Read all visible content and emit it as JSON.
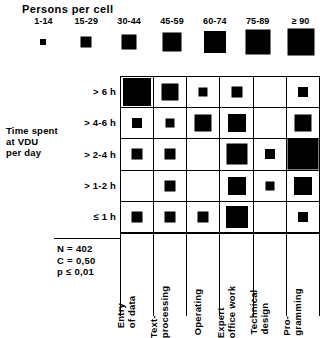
{
  "legend": {
    "title": "Persons per cell",
    "items": [
      {
        "label": "1-14",
        "size": 6,
        "range_min": 1,
        "range_max": 14
      },
      {
        "label": "15-29",
        "size": 11,
        "range_min": 15,
        "range_max": 29
      },
      {
        "label": "30-44",
        "size": 15,
        "range_min": 30,
        "range_max": 44
      },
      {
        "label": "45-59",
        "size": 19,
        "range_min": 45,
        "range_max": 59
      },
      {
        "label": "60-74",
        "size": 22,
        "range_min": 60,
        "range_max": 74
      },
      {
        "label": "75-89",
        "size": 25,
        "range_min": 75,
        "range_max": 89
      },
      {
        "label": "≥ 90",
        "size": 27,
        "range_min": 90,
        "range_max": null
      }
    ]
  },
  "y_axis": {
    "title": "Time spent\nat VDU\nper day",
    "title_lines": [
      "Time spent",
      "at VDU",
      "per day"
    ],
    "categories": [
      "> 6 h",
      "> 4-6 h",
      "> 2-4 h",
      "> 1-2 h",
      "≤ 1 h"
    ]
  },
  "x_axis": {
    "categories": [
      "Entry of data",
      "Text-processing",
      "Operating",
      "Expert office work",
      "Technical design",
      "Pro-gramming"
    ],
    "category_lines": [
      [
        "Entry",
        "of data"
      ],
      [
        "Text-",
        "processing"
      ],
      [
        "Operating"
      ],
      [
        "Expert",
        "office work"
      ],
      [
        "Technical",
        "design"
      ],
      [
        "Pro-",
        "gramming"
      ]
    ]
  },
  "stats": {
    "n_label": "N = 402",
    "c_label": "C = 0,50",
    "p_label": "p ≤ 0,01"
  },
  "chart_data": {
    "type": "heatmap",
    "title": "Persons per cell",
    "subtype": "size-coded matrix (symbol-area plot)",
    "xlabel": "",
    "ylabel": "Time spent at VDU per day",
    "grid": true,
    "legend_position": "top",
    "legend_title": "Persons per cell",
    "legend_bins": [
      "1-14",
      "15-29",
      "30-44",
      "45-59",
      "60-74",
      "75-89",
      "≥ 90"
    ],
    "legend_bin_sizes_px": [
      6,
      11,
      15,
      19,
      22,
      25,
      27
    ],
    "x_categories": [
      "Entry of data",
      "Text-processing",
      "Operating",
      "Expert office work",
      "Technical design",
      "Pro-gramming"
    ],
    "y_categories": [
      "> 6 h",
      "> 4-6 h",
      "> 2-4 h",
      "> 1-2 h",
      "≤ 1 h"
    ],
    "cells": [
      {
        "row": "> 6 h",
        "col": "Entry of data",
        "bin": "≥ 90",
        "size": 28
      },
      {
        "row": "> 6 h",
        "col": "Text-processing",
        "bin": "45-59",
        "size": 17
      },
      {
        "row": "> 6 h",
        "col": "Operating",
        "bin": "1-14",
        "size": 9
      },
      {
        "row": "> 6 h",
        "col": "Expert office work",
        "bin": "15-29",
        "size": 11
      },
      {
        "row": "> 6 h",
        "col": "Technical design",
        "bin": null,
        "size": 0
      },
      {
        "row": "> 6 h",
        "col": "Pro-gramming",
        "bin": "15-29",
        "size": 10
      },
      {
        "row": "> 4-6 h",
        "col": "Entry of data",
        "bin": "15-29",
        "size": 10
      },
      {
        "row": "> 4-6 h",
        "col": "Text-processing",
        "bin": "1-14",
        "size": 9
      },
      {
        "row": "> 4-6 h",
        "col": "Operating",
        "bin": "45-59",
        "size": 17
      },
      {
        "row": "> 4-6 h",
        "col": "Expert office work",
        "bin": "45-59",
        "size": 18
      },
      {
        "row": "> 4-6 h",
        "col": "Technical design",
        "bin": null,
        "size": 0
      },
      {
        "row": "> 4-6 h",
        "col": "Pro-gramming",
        "bin": "45-59",
        "size": 17
      },
      {
        "row": "> 2-4 h",
        "col": "Entry of data",
        "bin": "15-29",
        "size": 11
      },
      {
        "row": "> 2-4 h",
        "col": "Text-processing",
        "bin": "15-29",
        "size": 11
      },
      {
        "row": "> 2-4 h",
        "col": "Operating",
        "bin": null,
        "size": 0
      },
      {
        "row": "> 2-4 h",
        "col": "Expert office work",
        "bin": "60-74",
        "size": 21
      },
      {
        "row": "> 2-4 h",
        "col": "Technical design",
        "bin": "1-14",
        "size": 10
      },
      {
        "row": "> 2-4 h",
        "col": "Pro-gramming",
        "bin": "≥ 90",
        "size": 31
      },
      {
        "row": "> 1-2 h",
        "col": "Entry of data",
        "bin": null,
        "size": 0
      },
      {
        "row": "> 1-2 h",
        "col": "Text-processing",
        "bin": "15-29",
        "size": 11
      },
      {
        "row": "> 1-2 h",
        "col": "Operating",
        "bin": null,
        "size": 0
      },
      {
        "row": "> 1-2 h",
        "col": "Expert office work",
        "bin": "45-59",
        "size": 18
      },
      {
        "row": "> 1-2 h",
        "col": "Technical design",
        "bin": "1-14",
        "size": 9
      },
      {
        "row": "> 1-2 h",
        "col": "Pro-gramming",
        "bin": "45-59",
        "size": 18
      },
      {
        "row": "≤ 1 h",
        "col": "Entry of data",
        "bin": "15-29",
        "size": 11
      },
      {
        "row": "≤ 1 h",
        "col": "Text-processing",
        "bin": "15-29",
        "size": 11
      },
      {
        "row": "≤ 1 h",
        "col": "Operating",
        "bin": "15-29",
        "size": 11
      },
      {
        "row": "≤ 1 h",
        "col": "Expert office work",
        "bin": "60-74",
        "size": 22
      },
      {
        "row": "≤ 1 h",
        "col": "Technical design",
        "bin": null,
        "size": 0
      },
      {
        "row": "≤ 1 h",
        "col": "Pro-gramming",
        "bin": "15-29",
        "size": 10
      }
    ],
    "annotations": [
      "N = 402",
      "C = 0,50",
      "p ≤ 0,01"
    ]
  }
}
